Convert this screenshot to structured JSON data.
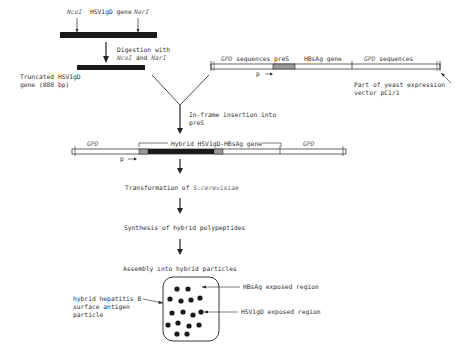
{
  "top_gene": {
    "site_left": "NcoI",
    "gene_label": "HSV1gD gene",
    "site_right": "NarI"
  },
  "step_digestion": {
    "line1": "Digestion with",
    "line2_a": "NcoI",
    "line2_b": " and ",
    "line2_c": "NarI"
  },
  "truncated": {
    "line1": "Truncated HSV1gD",
    "line2": "gene (888 bp)"
  },
  "vector": {
    "gpd_left": "GPD",
    "gpd_left_suffix": " sequences",
    "pres": "preS",
    "hbsag": "HBsAg gene",
    "gpd_right": "GPD",
    "gpd_right_suffix": " sequences",
    "promoter": "p",
    "caption_line1": "Part of yeast expression",
    "caption_line2": "vector pC1/1"
  },
  "step_insertion": {
    "line1": "In-frame insertion into",
    "line2": "preS"
  },
  "hybrid": {
    "gpd_left": "GPD",
    "label": "Hybrid HSV1gD-HBsAg gene",
    "gpd_right": "GPD",
    "promoter": "p"
  },
  "steps": {
    "transformation_prefix": "Transformation of ",
    "transformation_organism": "S.cerevisiae",
    "synthesis": "Synthesis of hybrid polypeptides",
    "assembly": "Assembly into hybrid particles"
  },
  "particle": {
    "label_line1": "hybrid hepatitis B",
    "label_line2": "surface antigen",
    "label_line3": "particle",
    "hbsag_region": "HBsAg exposed region",
    "hsv_region": "HSV1gD exposed region"
  },
  "colors": {
    "ink": "#222222",
    "gene_fill": "#1a1a1a",
    "pres_fill": "#9a9a9a",
    "text": "#333333"
  }
}
